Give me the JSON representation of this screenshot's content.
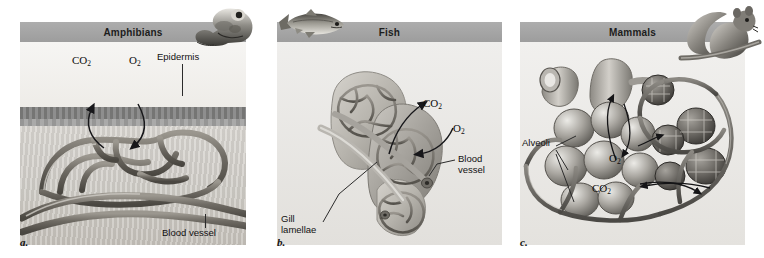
{
  "figure": {
    "accent_header_color": "#a3a3a3",
    "stage_color": "#e9e9e7",
    "text_color": "#111111"
  },
  "panels": [
    {
      "id": "a",
      "caption": "a.",
      "header": "Amphibians",
      "animal_icon": "frog-icon",
      "labels": [
        {
          "name": "co2-label",
          "text": "CO₂"
        },
        {
          "name": "o2-label",
          "text": "O₂"
        },
        {
          "name": "epidermis-label",
          "text": "Epidermis"
        },
        {
          "name": "blood-vessel-label",
          "text": "Blood vessel"
        }
      ]
    },
    {
      "id": "b",
      "caption": "b.",
      "header": "Fish",
      "animal_icon": "fish-icon",
      "labels": [
        {
          "name": "co2-label",
          "text": "CO₂"
        },
        {
          "name": "o2-label",
          "text": "O₂"
        },
        {
          "name": "blood-vessel-label",
          "text": "Blood vessel"
        },
        {
          "name": "gill-lamellae-label",
          "text": "Gill lamellae"
        }
      ]
    },
    {
      "id": "c",
      "caption": "c.",
      "header": "Mammals",
      "animal_icon": "chipmunk-icon",
      "labels": [
        {
          "name": "alveoli-label",
          "text": "Alveoli"
        },
        {
          "name": "o2-label",
          "text": "O₂"
        },
        {
          "name": "co2-label",
          "text": "CO₂"
        }
      ]
    }
  ]
}
